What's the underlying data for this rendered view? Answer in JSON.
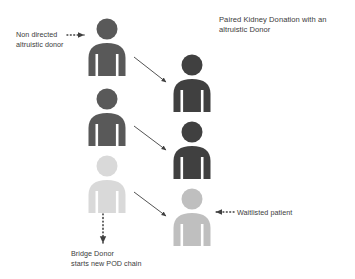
{
  "diagram": {
    "title": "Paired Kidney Donation with an altruistic Donor",
    "background_color": "#ffffff",
    "text_color": "#3b3b3b",
    "colors": {
      "donor_dark": "#595959",
      "recipient_dark": "#404040",
      "bridge_donor_light": "#d9d9d9",
      "waitlisted_medium": "#bfbfbf",
      "arrow": "#3f3f3f"
    },
    "labels": {
      "non_directed_donor": "Non directed\naltruistic donor",
      "waitlisted_patient": "Waitlisted patient",
      "bridge_donor": "Bridge Donor\nstarts new POD chain"
    },
    "figures": [
      {
        "id": "altruistic-donor",
        "role": "Non directed altruistic donor",
        "column": "left",
        "row": 1,
        "color": "#595959"
      },
      {
        "id": "recipient-1",
        "role": "Recipient 1",
        "column": "right",
        "row": 1,
        "color": "#404040"
      },
      {
        "id": "paired-donor-1",
        "role": "Paired donor 1",
        "column": "left",
        "row": 2,
        "color": "#595959"
      },
      {
        "id": "recipient-2",
        "role": "Recipient 2",
        "column": "right",
        "row": 2,
        "color": "#404040"
      },
      {
        "id": "bridge-donor",
        "role": "Bridge donor",
        "column": "left",
        "row": 3,
        "color": "#d9d9d9"
      },
      {
        "id": "waitlisted-patient",
        "role": "Waitlisted patient",
        "column": "right",
        "row": 3,
        "color": "#bfbfbf"
      }
    ],
    "arrows": [
      {
        "id": "donation-1",
        "style": "solid",
        "from": "altruistic-donor",
        "to": "recipient-1"
      },
      {
        "id": "donation-2",
        "style": "solid",
        "from": "paired-donor-1",
        "to": "recipient-2"
      },
      {
        "id": "donation-3",
        "style": "solid",
        "from": "bridge-donor",
        "to": "waitlisted-patient"
      },
      {
        "id": "non-directed-donor-pointer",
        "style": "dotted",
        "direction": "right",
        "to": "altruistic-donor"
      },
      {
        "id": "waitlisted-patient-pointer",
        "style": "dotted",
        "direction": "left",
        "to": "waitlisted-patient"
      },
      {
        "id": "bridge-donor-chain",
        "style": "dotted",
        "direction": "down",
        "from": "bridge-donor"
      }
    ]
  }
}
